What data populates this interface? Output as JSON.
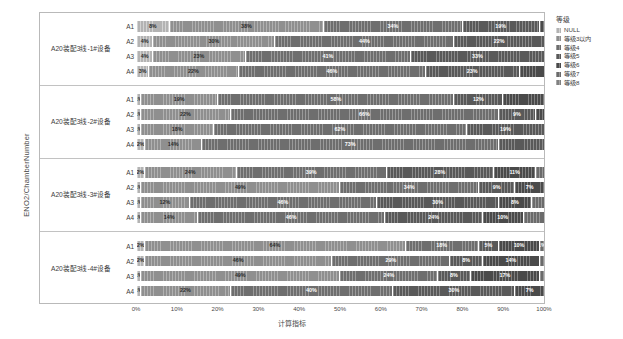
{
  "axes": {
    "y_title": "ENO2/ChamberNumber",
    "x_title": "计算指标",
    "x_ticks": [
      "0%",
      "10%",
      "20%",
      "30%",
      "40%",
      "50%",
      "60%",
      "70%",
      "80%",
      "90%",
      "100%"
    ]
  },
  "legend": {
    "title": "等级",
    "items": [
      {
        "label": "NULL",
        "color": "#b3b3b3"
      },
      {
        "label": "等级3以内",
        "color": "#8f8f8f"
      },
      {
        "label": "等级4",
        "color": "#6e6e6e"
      },
      {
        "label": "等级5",
        "color": "#595959"
      },
      {
        "label": "等级6",
        "color": "#4a4a4a"
      },
      {
        "label": "等级7",
        "color": "#6b6b6b"
      },
      {
        "label": "等级8",
        "color": "#818181"
      }
    ]
  },
  "chart_data": {
    "type": "bar",
    "orientation": "horizontal",
    "stacked": true,
    "normalized": true,
    "title": "",
    "xlabel": "计算指标",
    "ylabel": "ENO2/ChamberNumber",
    "xlim": [
      0,
      100
    ],
    "grid": false,
    "series": [
      {
        "name": "NULL",
        "color": "#b3b3b3"
      },
      {
        "name": "等级3以内",
        "color": "#8f8f8f"
      },
      {
        "name": "等级4",
        "color": "#6e6e6e"
      },
      {
        "name": "等级5",
        "color": "#595959"
      },
      {
        "name": "等级6",
        "color": "#4a4a4a"
      },
      {
        "name": "等级7",
        "color": "#6b6b6b"
      },
      {
        "name": "等级8",
        "color": "#818181"
      }
    ],
    "groups": [
      {
        "label": "A20装配3线-1#设备",
        "rows": [
          {
            "cat": "A1",
            "segments": [
              {
                "series": "NULL",
                "value": 8,
                "label": "8%"
              },
              {
                "series": "等级3以内",
                "value": 38,
                "label": "38%"
              },
              {
                "series": "等级4",
                "value": 34,
                "label": "34%"
              },
              {
                "series": "等级5",
                "value": 19,
                "label": "19%"
              },
              {
                "series": "等级6",
                "value": 1,
                "label": ""
              }
            ]
          },
          {
            "cat": "A2",
            "segments": [
              {
                "series": "NULL",
                "value": 4,
                "label": "4%"
              },
              {
                "series": "等级3以内",
                "value": 30,
                "label": "30%"
              },
              {
                "series": "等级4",
                "value": 44,
                "label": "44%"
              },
              {
                "series": "等级5",
                "value": 22,
                "label": "22%"
              }
            ]
          },
          {
            "cat": "A3",
            "segments": [
              {
                "series": "NULL",
                "value": 4,
                "label": "4%"
              },
              {
                "series": "等级3以内",
                "value": 23,
                "label": "23%"
              },
              {
                "series": "等级4",
                "value": 41,
                "label": "41%"
              },
              {
                "series": "等级5",
                "value": 33,
                "label": "33%"
              }
            ]
          },
          {
            "cat": "A4",
            "segments": [
              {
                "series": "NULL",
                "value": 3,
                "label": "3%"
              },
              {
                "series": "等级3以内",
                "value": 22,
                "label": "22%"
              },
              {
                "series": "等级4",
                "value": 46,
                "label": "46%"
              },
              {
                "series": "等级5",
                "value": 23,
                "label": "23%"
              },
              {
                "series": "等级6",
                "value": 6,
                "label": ""
              }
            ]
          }
        ]
      },
      {
        "label": "A20装配3线-2#设备",
        "rows": [
          {
            "cat": "A1",
            "segments": [
              {
                "series": "NULL",
                "value": 1,
                "label": "1%"
              },
              {
                "series": "等级3以内",
                "value": 19,
                "label": "19%"
              },
              {
                "series": "等级4",
                "value": 58,
                "label": "58%"
              },
              {
                "series": "等级5",
                "value": 12,
                "label": "12%"
              },
              {
                "series": "等级6",
                "value": 10,
                "label": ""
              }
            ]
          },
          {
            "cat": "A2",
            "segments": [
              {
                "series": "NULL",
                "value": 1,
                "label": "1%"
              },
              {
                "series": "等级3以内",
                "value": 22,
                "label": "22%"
              },
              {
                "series": "等级4",
                "value": 66,
                "label": "66%"
              },
              {
                "series": "等级5",
                "value": 9,
                "label": "9%"
              },
              {
                "series": "等级6",
                "value": 2,
                "label": ""
              }
            ]
          },
          {
            "cat": "A3",
            "segments": [
              {
                "series": "NULL",
                "value": 1,
                "label": "1%"
              },
              {
                "series": "等级3以内",
                "value": 18,
                "label": "18%"
              },
              {
                "series": "等级4",
                "value": 62,
                "label": "62%"
              },
              {
                "series": "等级5",
                "value": 19,
                "label": "19%"
              }
            ]
          },
          {
            "cat": "A4",
            "segments": [
              {
                "series": "NULL",
                "value": 2,
                "label": "2%"
              },
              {
                "series": "等级3以内",
                "value": 14,
                "label": "14%"
              },
              {
                "series": "等级4",
                "value": 73,
                "label": "73%"
              },
              {
                "series": "等级5",
                "value": 11,
                "label": ""
              }
            ]
          }
        ]
      },
      {
        "label": "A20装配3线-3#设备",
        "rows": [
          {
            "cat": "A1",
            "segments": [
              {
                "series": "NULL",
                "value": 2,
                "label": "2%"
              },
              {
                "series": "等级3以内",
                "value": 24,
                "label": "24%"
              },
              {
                "series": "等级4",
                "value": 39,
                "label": "39%"
              },
              {
                "series": "等级5",
                "value": 28,
                "label": "28%"
              },
              {
                "series": "等级6",
                "value": 11,
                "label": "11%"
              },
              {
                "series": "等级7",
                "value": 2,
                "label": ""
              }
            ]
          },
          {
            "cat": "A2",
            "segments": [
              {
                "series": "NULL",
                "value": 1,
                "label": "1%"
              },
              {
                "series": "等级3以内",
                "value": 49,
                "label": "49%"
              },
              {
                "series": "等级4",
                "value": 34,
                "label": "34%"
              },
              {
                "series": "等级5",
                "value": 9,
                "label": "9%"
              },
              {
                "series": "等级6",
                "value": 7,
                "label": "7%"
              }
            ]
          },
          {
            "cat": "A3",
            "segments": [
              {
                "series": "NULL",
                "value": 1,
                "label": "1%"
              },
              {
                "series": "等级3以内",
                "value": 12,
                "label": "12%"
              },
              {
                "series": "等级4",
                "value": 46,
                "label": "46%"
              },
              {
                "series": "等级5",
                "value": 30,
                "label": "30%"
              },
              {
                "series": "等级6",
                "value": 8,
                "label": "8%"
              },
              {
                "series": "等级7",
                "value": 3,
                "label": ""
              }
            ]
          },
          {
            "cat": "A4",
            "segments": [
              {
                "series": "NULL",
                "value": 1,
                "label": "1%"
              },
              {
                "series": "等级3以内",
                "value": 14,
                "label": "14%"
              },
              {
                "series": "等级4",
                "value": 46,
                "label": "46%"
              },
              {
                "series": "等级5",
                "value": 24,
                "label": "24%"
              },
              {
                "series": "等级6",
                "value": 10,
                "label": "10%"
              },
              {
                "series": "等级7",
                "value": 5,
                "label": ""
              }
            ]
          }
        ]
      },
      {
        "label": "A20装配3线-4#设备",
        "rows": [
          {
            "cat": "A1",
            "segments": [
              {
                "series": "NULL",
                "value": 2,
                "label": "2%"
              },
              {
                "series": "等级3以内",
                "value": 64,
                "label": "64%"
              },
              {
                "series": "等级4",
                "value": 18,
                "label": "18%"
              },
              {
                "series": "等级5",
                "value": 5,
                "label": "5%"
              },
              {
                "series": "等级6",
                "value": 10,
                "label": "10%"
              },
              {
                "series": "等级7",
                "value": 1,
                "label": "1%"
              }
            ]
          },
          {
            "cat": "A2",
            "segments": [
              {
                "series": "NULL",
                "value": 2,
                "label": "2%"
              },
              {
                "series": "等级3以内",
                "value": 46,
                "label": "46%"
              },
              {
                "series": "等级4",
                "value": 29,
                "label": "29%"
              },
              {
                "series": "等级5",
                "value": 8,
                "label": "8%"
              },
              {
                "series": "等级6",
                "value": 14,
                "label": "14%"
              },
              {
                "series": "等级7",
                "value": 1,
                "label": ""
              }
            ]
          },
          {
            "cat": "A3",
            "segments": [
              {
                "series": "NULL",
                "value": 1,
                "label": "1%"
              },
              {
                "series": "等级3以内",
                "value": 49,
                "label": "49%"
              },
              {
                "series": "等级4",
                "value": 24,
                "label": "24%"
              },
              {
                "series": "等级5",
                "value": 8,
                "label": "8%"
              },
              {
                "series": "等级6",
                "value": 17,
                "label": "17%"
              },
              {
                "series": "等级7",
                "value": 1,
                "label": ""
              }
            ]
          },
          {
            "cat": "A4",
            "segments": [
              {
                "series": "NULL",
                "value": 1,
                "label": "1%"
              },
              {
                "series": "等级3以内",
                "value": 22,
                "label": "22%"
              },
              {
                "series": "等级4",
                "value": 40,
                "label": "40%"
              },
              {
                "series": "等级5",
                "value": 30,
                "label": "30%"
              },
              {
                "series": "等级6",
                "value": 7,
                "label": "7%"
              }
            ]
          }
        ]
      }
    ]
  }
}
